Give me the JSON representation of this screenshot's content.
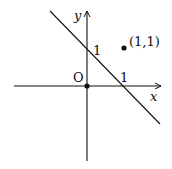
{
  "diagram": {
    "type": "coordinate-plane",
    "axes": {
      "x_label": "x",
      "y_label": "y",
      "origin_label": "O"
    },
    "line": {
      "equation": "x + y = 1",
      "x_intercept_label": "1",
      "y_intercept_label": "1"
    },
    "points": [
      {
        "label": "(1,1)",
        "x": 1,
        "y": 1
      },
      {
        "label": "",
        "x": 0,
        "y": 0
      }
    ],
    "colors": {
      "stroke": "#111111",
      "background": "#ffffff"
    }
  }
}
